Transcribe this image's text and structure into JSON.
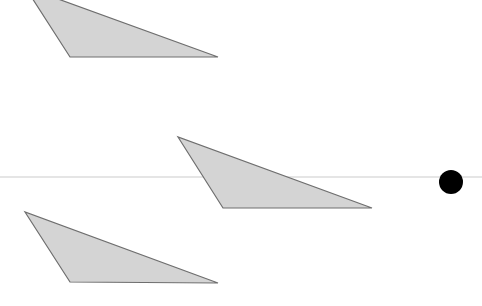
{
  "canvas": {
    "width": 482,
    "height": 306,
    "background": "#ffffff"
  },
  "colors": {
    "triangle_fill": "#d4d4d4",
    "triangle_stroke": "#6e6e6e",
    "line": "#dcdcdc",
    "circle": "#000000"
  },
  "shapes": {
    "triangles": [
      {
        "id": "triangle-top",
        "points": [
          [
            25,
            -13
          ],
          [
            70,
            57
          ],
          [
            218,
            57
          ]
        ]
      },
      {
        "id": "triangle-middle",
        "points": [
          [
            178,
            137
          ],
          [
            223,
            208
          ],
          [
            372,
            208
          ]
        ]
      },
      {
        "id": "triangle-bottom",
        "points": [
          [
            25,
            212
          ],
          [
            70,
            282
          ],
          [
            218,
            283
          ]
        ]
      }
    ],
    "line": {
      "x1": 0,
      "y1": 177,
      "x2": 482,
      "y2": 177,
      "width": 1.5
    },
    "circle": {
      "cx": 451,
      "cy": 182,
      "r": 12
    }
  }
}
